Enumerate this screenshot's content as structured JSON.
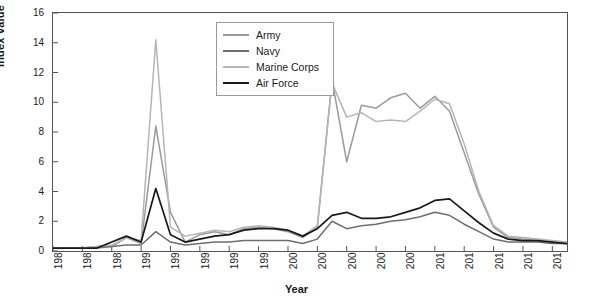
{
  "chart_data": {
    "type": "line",
    "title": "",
    "xlabel": "Year",
    "ylabel": "Index value",
    "xlim": [
      1984,
      2019
    ],
    "ylim": [
      0,
      16
    ],
    "ytick_values": [
      0,
      2,
      4,
      6,
      8,
      10,
      12,
      14,
      16
    ],
    "xtick_values": [
      1984,
      1986,
      1988,
      1990,
      1992,
      1994,
      1996,
      1998,
      2000,
      2002,
      2004,
      2006,
      2008,
      2010,
      2012,
      2014,
      2016,
      2018
    ],
    "grid": false,
    "legend_position": "top-center",
    "x": [
      1984,
      1985,
      1986,
      1987,
      1988,
      1989,
      1990,
      1991,
      1992,
      1993,
      1994,
      1995,
      1996,
      1997,
      1998,
      1999,
      2000,
      2001,
      2002,
      2003,
      2004,
      2005,
      2006,
      2007,
      2008,
      2009,
      2010,
      2011,
      2012,
      2013,
      2014,
      2015,
      2016,
      2017,
      2018,
      2019
    ],
    "series": [
      {
        "name": "Army",
        "color": "#9b9b9b",
        "values": [
          0.2,
          0.2,
          0.2,
          0.3,
          0.3,
          0.9,
          0.5,
          8.4,
          2.6,
          0.6,
          1.1,
          1.3,
          1.1,
          1.5,
          1.6,
          1.5,
          1.3,
          0.9,
          1.6,
          11.5,
          6.0,
          9.8,
          9.6,
          10.3,
          10.6,
          9.6,
          10.4,
          9.4,
          6.6,
          3.8,
          1.6,
          0.9,
          0.8,
          0.7,
          0.6,
          0.5
        ]
      },
      {
        "name": "Navy",
        "color": "#6e6e6e",
        "values": [
          0.2,
          0.2,
          0.2,
          0.2,
          0.3,
          0.4,
          0.4,
          1.3,
          0.6,
          0.4,
          0.5,
          0.6,
          0.6,
          0.7,
          0.7,
          0.7,
          0.7,
          0.5,
          0.8,
          2.0,
          1.5,
          1.7,
          1.8,
          2.0,
          2.1,
          2.3,
          2.6,
          2.4,
          1.8,
          1.3,
          0.8,
          0.6,
          0.6,
          0.6,
          0.5,
          0.5
        ]
      },
      {
        "name": "Marine Corps",
        "color": "#b5b5b5",
        "values": [
          0.2,
          0.2,
          0.2,
          0.3,
          0.4,
          0.9,
          0.7,
          14.2,
          1.6,
          1.0,
          1.2,
          1.4,
          1.3,
          1.6,
          1.7,
          1.6,
          1.4,
          1.0,
          1.7,
          11.3,
          9.0,
          9.3,
          8.7,
          8.8,
          8.7,
          9.4,
          10.2,
          9.9,
          7.2,
          4.0,
          1.7,
          1.0,
          0.9,
          0.8,
          0.7,
          0.6
        ]
      },
      {
        "name": "Air Force",
        "color": "#1a1a1a",
        "values": [
          0.2,
          0.2,
          0.2,
          0.2,
          0.6,
          1.0,
          0.6,
          4.2,
          1.1,
          0.6,
          0.8,
          1.0,
          1.1,
          1.4,
          1.5,
          1.5,
          1.4,
          1.0,
          1.5,
          2.4,
          2.6,
          2.2,
          2.2,
          2.3,
          2.6,
          2.9,
          3.4,
          3.5,
          2.7,
          1.9,
          1.2,
          0.8,
          0.7,
          0.7,
          0.6,
          0.5
        ]
      }
    ]
  },
  "axes": {
    "y_title": "Index value",
    "x_title": "Year",
    "y_ticks": [
      "0",
      "2",
      "4",
      "6",
      "8",
      "10",
      "12",
      "14",
      "16"
    ],
    "x_ticks": [
      "1984",
      "1986",
      "1988",
      "1990",
      "1992",
      "1994",
      "1996",
      "1998",
      "2000",
      "2002",
      "2004",
      "2006",
      "2008",
      "2010",
      "2012",
      "2014",
      "2016",
      "2018"
    ]
  },
  "legend": {
    "items": [
      {
        "label": "Army",
        "color": "#9b9b9b"
      },
      {
        "label": "Navy",
        "color": "#6e6e6e"
      },
      {
        "label": "Marine Corps",
        "color": "#b5b5b5"
      },
      {
        "label": "Air Force",
        "color": "#1a1a1a"
      }
    ]
  }
}
